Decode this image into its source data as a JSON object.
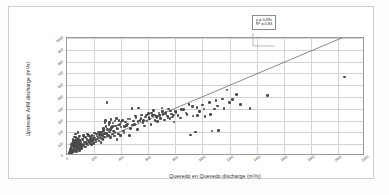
{
  "chart_data": {
    "type": "scatter",
    "title": "",
    "xlabel": "Quevedo en Quevedo discharge (m³/s)",
    "ylabel": "Upstream AdM discharge (m³/s)",
    "xlim": [
      0,
      2200
    ],
    "ylim": [
      0,
      1000
    ],
    "xticks": [
      0,
      200,
      400,
      600,
      800,
      1000,
      1200,
      1400,
      1600,
      1800,
      2000,
      2200
    ],
    "yticks": [
      0,
      100,
      200,
      300,
      400,
      500,
      600,
      700,
      800,
      900,
      1000
    ],
    "grid": true,
    "legend": false,
    "marker_color": "#4a4a4a",
    "trendline_color": "#555555",
    "annotations": {
      "equation": "y = 0.49x",
      "r_squared": "R² = 0.83"
    },
    "trendline": {
      "type": "linear-through-origin",
      "slope": 0.49,
      "intercept": 0,
      "x_start": 0,
      "x_end": 2200
    },
    "points": [
      [
        18,
        30
      ],
      [
        22,
        42
      ],
      [
        25,
        18
      ],
      [
        28,
        55
      ],
      [
        30,
        70
      ],
      [
        32,
        38
      ],
      [
        34,
        95
      ],
      [
        36,
        22
      ],
      [
        38,
        60
      ],
      [
        40,
        110
      ],
      [
        42,
        48
      ],
      [
        44,
        140
      ],
      [
        46,
        80
      ],
      [
        48,
        35
      ],
      [
        50,
        125
      ],
      [
        52,
        65
      ],
      [
        54,
        160
      ],
      [
        56,
        95
      ],
      [
        58,
        45
      ],
      [
        60,
        115
      ],
      [
        62,
        75
      ],
      [
        64,
        185
      ],
      [
        66,
        55
      ],
      [
        68,
        130
      ],
      [
        70,
        90
      ],
      [
        72,
        40
      ],
      [
        74,
        150
      ],
      [
        76,
        105
      ],
      [
        78,
        68
      ],
      [
        80,
        200
      ],
      [
        82,
        85
      ],
      [
        84,
        58
      ],
      [
        86,
        118
      ],
      [
        88,
        72
      ],
      [
        90,
        165
      ],
      [
        92,
        95
      ],
      [
        94,
        48
      ],
      [
        96,
        135
      ],
      [
        98,
        78
      ],
      [
        100,
        108
      ],
      [
        105,
        62
      ],
      [
        110,
        145
      ],
      [
        115,
        88
      ],
      [
        120,
        172
      ],
      [
        125,
        98
      ],
      [
        130,
        120
      ],
      [
        135,
        75
      ],
      [
        140,
        155
      ],
      [
        145,
        105
      ],
      [
        150,
        185
      ],
      [
        155,
        92
      ],
      [
        160,
        128
      ],
      [
        165,
        112
      ],
      [
        170,
        165
      ],
      [
        175,
        140
      ],
      [
        180,
        98
      ],
      [
        185,
        175
      ],
      [
        190,
        125
      ],
      [
        195,
        150
      ],
      [
        200,
        108
      ],
      [
        205,
        195
      ],
      [
        210,
        135
      ],
      [
        215,
        118
      ],
      [
        220,
        168
      ],
      [
        225,
        145
      ],
      [
        230,
        205
      ],
      [
        235,
        128
      ],
      [
        240,
        182
      ],
      [
        245,
        155
      ],
      [
        250,
        115
      ],
      [
        255,
        198
      ],
      [
        260,
        172
      ],
      [
        265,
        138
      ],
      [
        270,
        215
      ],
      [
        275,
        160
      ],
      [
        280,
        285
      ],
      [
        285,
        302
      ],
      [
        290,
        190
      ],
      [
        295,
        455
      ],
      [
        300,
        225
      ],
      [
        305,
        175
      ],
      [
        310,
        265
      ],
      [
        315,
        205
      ],
      [
        320,
        155
      ],
      [
        325,
        310
      ],
      [
        330,
        240
      ],
      [
        335,
        185
      ],
      [
        340,
        278
      ],
      [
        345,
        212
      ],
      [
        350,
        168
      ],
      [
        355,
        295
      ],
      [
        360,
        255
      ],
      [
        365,
        320
      ],
      [
        370,
        140
      ],
      [
        375,
        228
      ],
      [
        380,
        185
      ],
      [
        385,
        302
      ],
      [
        390,
        265
      ],
      [
        395,
        175
      ],
      [
        400,
        245
      ],
      [
        410,
        300
      ],
      [
        415,
        212
      ],
      [
        420,
        195
      ],
      [
        430,
        288
      ],
      [
        440,
        258
      ],
      [
        450,
        315
      ],
      [
        460,
        172
      ],
      [
        470,
        232
      ],
      [
        480,
        405
      ],
      [
        490,
        295
      ],
      [
        500,
        268
      ],
      [
        510,
        325
      ],
      [
        520,
        225
      ],
      [
        530,
        408
      ],
      [
        540,
        302
      ],
      [
        550,
        348
      ],
      [
        560,
        285
      ],
      [
        570,
        255
      ],
      [
        580,
        332
      ],
      [
        590,
        295
      ],
      [
        600,
        358
      ],
      [
        610,
        312
      ],
      [
        620,
        268
      ],
      [
        630,
        345
      ],
      [
        640,
        385
      ],
      [
        650,
        302
      ],
      [
        660,
        335
      ],
      [
        670,
        292
      ],
      [
        680,
        365
      ],
      [
        690,
        318
      ],
      [
        700,
        408
      ],
      [
        710,
        352
      ],
      [
        720,
        305
      ],
      [
        730,
        372
      ],
      [
        740,
        338
      ],
      [
        750,
        398
      ],
      [
        760,
        318
      ],
      [
        770,
        355
      ],
      [
        780,
        332
      ],
      [
        790,
        288
      ],
      [
        800,
        375
      ],
      [
        820,
        345
      ],
      [
        840,
        322
      ],
      [
        860,
        392
      ],
      [
        880,
        365
      ],
      [
        900,
        438
      ],
      [
        910,
        178
      ],
      [
        930,
        340
      ],
      [
        950,
        205
      ],
      [
        960,
        412
      ],
      [
        980,
        378
      ],
      [
        1000,
        432
      ],
      [
        1020,
        335
      ],
      [
        1050,
        452
      ],
      [
        1070,
        212
      ],
      [
        1090,
        398
      ],
      [
        1100,
        468
      ],
      [
        1120,
        215
      ],
      [
        1150,
        482
      ],
      [
        1180,
        560
      ],
      [
        1200,
        455
      ],
      [
        1250,
        522
      ],
      [
        1280,
        438
      ],
      [
        1350,
        402
      ],
      [
        1480,
        512
      ],
      [
        2050,
        668
      ],
      [
        24,
        26
      ],
      [
        27,
        33
      ],
      [
        31,
        48
      ],
      [
        35,
        28
      ],
      [
        39,
        88
      ],
      [
        43,
        52
      ],
      [
        47,
        102
      ],
      [
        51,
        72
      ],
      [
        55,
        132
      ],
      [
        59,
        85
      ],
      [
        63,
        112
      ],
      [
        67,
        158
      ],
      [
        71,
        98
      ],
      [
        75,
        122
      ],
      [
        79,
        62
      ],
      [
        83,
        142
      ],
      [
        87,
        108
      ],
      [
        91,
        82
      ],
      [
        95,
        168
      ],
      [
        99,
        128
      ],
      [
        112,
        95
      ],
      [
        118,
        138
      ],
      [
        128,
        160
      ],
      [
        138,
        118
      ],
      [
        148,
        142
      ],
      [
        158,
        175
      ],
      [
        168,
        132
      ],
      [
        178,
        158
      ],
      [
        188,
        142
      ],
      [
        198,
        168
      ],
      [
        208,
        152
      ],
      [
        218,
        188
      ],
      [
        228,
        162
      ],
      [
        238,
        198
      ],
      [
        248,
        178
      ],
      [
        258,
        148
      ],
      [
        268,
        232
      ],
      [
        278,
        192
      ],
      [
        288,
        248
      ],
      [
        298,
        168
      ],
      [
        312,
        282
      ],
      [
        322,
        225
      ],
      [
        338,
        248
      ],
      [
        352,
        205
      ],
      [
        368,
        232
      ],
      [
        382,
        262
      ],
      [
        398,
        288
      ],
      [
        425,
        252
      ],
      [
        445,
        272
      ],
      [
        465,
        312
      ],
      [
        485,
        262
      ],
      [
        505,
        338
      ],
      [
        525,
        292
      ],
      [
        545,
        318
      ],
      [
        565,
        302
      ],
      [
        585,
        348
      ],
      [
        605,
        325
      ],
      [
        625,
        365
      ],
      [
        645,
        348
      ],
      [
        665,
        325
      ],
      [
        685,
        342
      ],
      [
        705,
        378
      ],
      [
        725,
        358
      ],
      [
        745,
        325
      ],
      [
        765,
        382
      ],
      [
        785,
        348
      ],
      [
        805,
        368
      ],
      [
        845,
        395
      ],
      [
        885,
        352
      ],
      [
        925,
        418
      ],
      [
        965,
        345
      ],
      [
        1010,
        398
      ],
      [
        1060,
        352
      ],
      [
        1110,
        425
      ],
      [
        1160,
        405
      ],
      [
        1220,
        478
      ]
    ]
  }
}
